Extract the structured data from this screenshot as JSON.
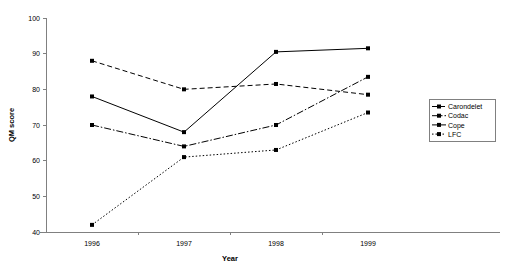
{
  "chart_data": {
    "type": "line",
    "title": "",
    "xlabel": "Year",
    "ylabel": "QM score",
    "x": [
      "1996",
      "1997",
      "1998",
      "1999"
    ],
    "categories": [
      "1996",
      "1997",
      "1998",
      "1999"
    ],
    "xtick_labels": [
      "1996",
      "1997",
      "1998",
      "1999"
    ],
    "ytick_labels": [
      "40",
      "50",
      "60",
      "70",
      "80",
      "90",
      "100"
    ],
    "yticks": [
      40,
      50,
      60,
      70,
      80,
      90,
      100
    ],
    "ylim": [
      40,
      100
    ],
    "grid": false,
    "legend_position": "right",
    "marker": "square",
    "color": "#000000",
    "series": [
      {
        "name": "Carondelet",
        "dash": "dashed",
        "dasharray": "5,3",
        "values": [
          88,
          80,
          81.5,
          78.5
        ]
      },
      {
        "name": "Codac",
        "dash": "dash-dot",
        "dasharray": "7,2,1.5,2",
        "values": [
          70,
          64,
          70,
          83.5
        ]
      },
      {
        "name": "Cope",
        "dash": "solid",
        "dasharray": "",
        "values": [
          78,
          68,
          90.5,
          91.5
        ]
      },
      {
        "name": "LFC",
        "dash": "dotted",
        "dasharray": "1.5,2",
        "values": [
          42,
          61,
          63,
          73.5
        ]
      }
    ]
  },
  "legend": {
    "items": [
      {
        "label": "Carondelet"
      },
      {
        "label": "Codac"
      },
      {
        "label": "Cope"
      },
      {
        "label": "LFC"
      }
    ]
  },
  "axes": {
    "x_title": "Year",
    "y_title": "QM score"
  }
}
